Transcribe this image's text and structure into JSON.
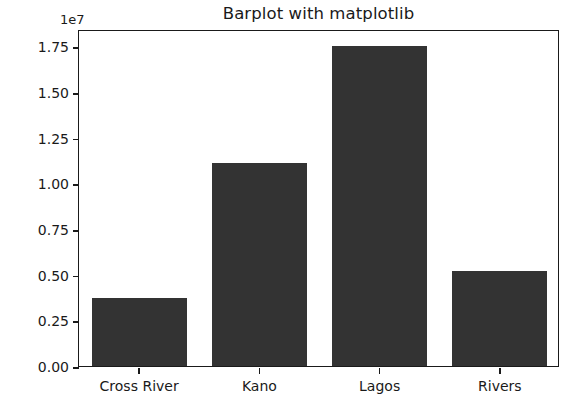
{
  "chart_data": {
    "type": "bar",
    "title": "Barplot with matplotlib",
    "xlabel": "",
    "ylabel": "",
    "categories": [
      "Cross River",
      "Kano",
      "Lagos",
      "Rivers"
    ],
    "values": [
      3750000,
      11100000,
      17530000,
      5200000
    ],
    "offset_text": "1e7",
    "y_tick_labels": [
      "0.00",
      "0.25",
      "0.50",
      "0.75",
      "1.00",
      "1.25",
      "1.50",
      "1.75"
    ],
    "y_tick_values": [
      0,
      2500000,
      5000000,
      7500000,
      10000000,
      12500000,
      15000000,
      17500000
    ],
    "ylim": [
      0,
      18450000
    ],
    "grid": false,
    "legend": null,
    "bar_color": "#333333",
    "axes_color": "#1a1a1a",
    "background_color": "#ffffff"
  }
}
